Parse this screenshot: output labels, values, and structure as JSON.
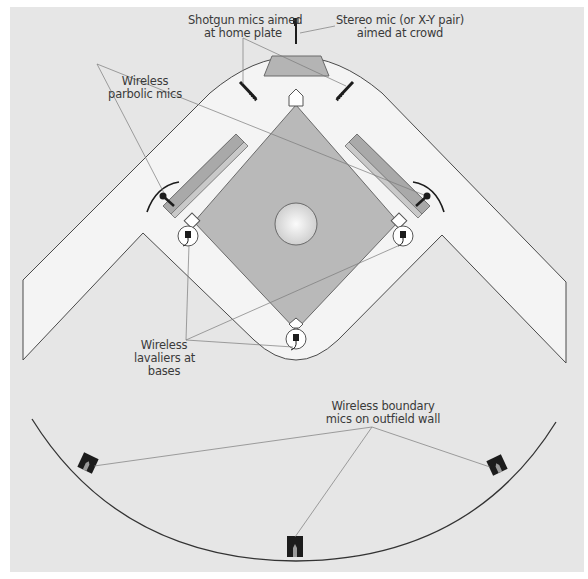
{
  "diagram": {
    "colors": {
      "background": "#e6e6e6",
      "field": "#f3f3f3",
      "infield": "#b9b9b9",
      "dugout": "#a9a9a9",
      "dugout_edge": "#c8c8c8",
      "outline": "#4a4a4a",
      "leader_line": "#7a7a7a",
      "mic": "#1c1c1c"
    },
    "labels": {
      "shotgun": {
        "line1": "Shotgun mics aimed",
        "line2": "at home plate"
      },
      "stereo": {
        "line1": "Stereo mic (or X-Y pair)",
        "line2": "aimed at crowd"
      },
      "parabolic": {
        "line1": "Wireless",
        "line2": "parbolic mics"
      },
      "lavaliers": {
        "line1": "Wireless",
        "line2": "lavaliers at",
        "line3": "bases"
      },
      "boundary": {
        "line1": "Wireless boundary",
        "line2": "mics on outfield wall"
      }
    },
    "elements": {
      "home_plate": "pentagon-home-plate",
      "pitchers_mound": "circle-mound",
      "bases": [
        "first-base",
        "second-base",
        "third-base"
      ],
      "mic_types": [
        "shotgun-mic",
        "stereo-mic",
        "parabolic-mic",
        "lavalier-mic",
        "boundary-mic"
      ]
    }
  }
}
